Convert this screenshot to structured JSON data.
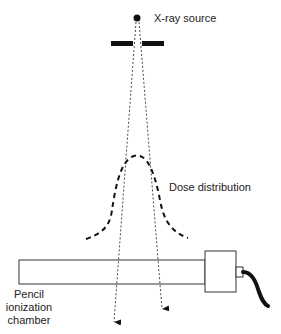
{
  "diagram": {
    "labels": {
      "source": "X-ray source",
      "dose": "Dose distribution",
      "chamber_line1": "Pencil",
      "chamber_line2": "ionization",
      "chamber_line3": "chamber"
    },
    "colors": {
      "ink": "#111111",
      "text": "#222222",
      "background": "#ffffff"
    },
    "elements": [
      "x-ray-source-dot",
      "collimator",
      "beam-edges",
      "dose-distribution-curve",
      "pencil-ionization-chamber",
      "connector",
      "cable"
    ]
  }
}
